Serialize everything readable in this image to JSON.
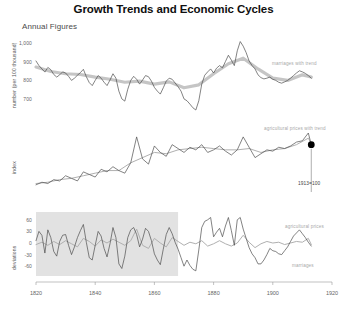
{
  "header": {
    "title": "Growth Trends and Economic Cycles",
    "subtitle": "Annual Figures"
  },
  "colors": {
    "series_dark": "#4d4d4d",
    "series_trend": "#c2c2c2",
    "series_light": "#b0b0b0",
    "shade_band": "#e2e2e2",
    "axis": "#999999",
    "marker": "#000000",
    "text": "#1a1a1a",
    "note": "#a9a9a9"
  },
  "chart_data": {
    "type": "line",
    "title": "Growth Trends and Economic Cycles",
    "subtitle": "Annual Figures",
    "xlabel": "",
    "xlim": [
      1820,
      1920
    ],
    "xticks": [
      1820,
      1840,
      1860,
      1880,
      1900,
      1920
    ],
    "grid": false,
    "legend_position": "inline-annotations",
    "panels": [
      {
        "id": "panel-marriages",
        "ylabel": "number (per 100 thousand)",
        "ylim": [
          640,
          1040
        ],
        "yticks": [
          1000,
          900,
          800,
          700
        ],
        "ytick_labels": [
          "1,000",
          "900",
          "800",
          "700"
        ],
        "annotations": [
          {
            "text": "marriages with trend",
            "x": 1898,
            "y": 900
          }
        ],
        "series": [
          {
            "name": "marriages",
            "style": "dark-thin",
            "x": [
              1820,
              1821,
              1822,
              1823,
              1824,
              1825,
              1826,
              1827,
              1828,
              1829,
              1830,
              1831,
              1832,
              1833,
              1834,
              1835,
              1836,
              1837,
              1838,
              1839,
              1840,
              1841,
              1842,
              1843,
              1844,
              1845,
              1846,
              1847,
              1848,
              1849,
              1850,
              1851,
              1852,
              1853,
              1854,
              1855,
              1856,
              1857,
              1858,
              1859,
              1860,
              1861,
              1862,
              1863,
              1864,
              1865,
              1866,
              1867,
              1868,
              1869,
              1870,
              1871,
              1872,
              1873,
              1874,
              1875,
              1876,
              1877,
              1878,
              1879,
              1880,
              1881,
              1882,
              1883,
              1884,
              1885,
              1886,
              1887,
              1888,
              1889,
              1890,
              1891,
              1892,
              1893,
              1894,
              1895,
              1896,
              1897,
              1898,
              1899,
              1900,
              1901,
              1902,
              1903,
              1904,
              1905,
              1906,
              1907,
              1908,
              1909,
              1910,
              1911,
              1912,
              1913
            ],
            "values": [
              905,
              880,
              862,
              845,
              870,
              858,
              832,
              818,
              830,
              846,
              840,
              822,
              800,
              812,
              828,
              842,
              860,
              820,
              788,
              772,
              800,
              826,
              812,
              790,
              772,
              802,
              836,
              812,
              742,
              700,
              688,
              752,
              800,
              822,
              806,
              780,
              802,
              826,
              820,
              796,
              762,
              742,
              726,
              760,
              796,
              812,
              806,
              786,
              766,
              742,
              700,
              690,
              672,
              652,
              640,
              690,
              780,
              828,
              846,
              862,
              840,
              866,
              880,
              868,
              902,
              936,
              910,
              880,
              960,
              1010,
              985,
              950,
              905,
              880,
              862,
              830,
              815,
              808,
              812,
              818,
              806,
              800,
              790,
              785,
              792,
              800,
              812,
              826,
              840,
              852,
              846,
              838,
              826,
              812
            ]
          },
          {
            "name": "marriages trend",
            "style": "trend-thick",
            "x": [
              1820,
              1825,
              1830,
              1835,
              1840,
              1845,
              1850,
              1855,
              1860,
              1865,
              1870,
              1875,
              1880,
              1885,
              1890,
              1895,
              1900,
              1905,
              1910,
              1913
            ],
            "values": [
              872,
              848,
              836,
              832,
              818,
              806,
              790,
              796,
              780,
              792,
              760,
              776,
              836,
              890,
              920,
              862,
              812,
              800,
              830,
              818
            ]
          }
        ]
      },
      {
        "id": "panel-prices",
        "ylabel": "index",
        "ylim": [
          30,
          135
        ],
        "yticks": [],
        "ytick_labels": [],
        "annotations": [
          {
            "text": "agricultural prices with trend",
            "x": 1898,
            "y": 128
          },
          {
            "text": "1913=100",
            "x": 1911,
            "y": 44,
            "marker": true
          }
        ],
        "marker": {
          "x": 1913,
          "y": 100,
          "label": "1913=100"
        },
        "series": [
          {
            "name": "agricultural prices",
            "style": "dark-thin",
            "x": [
              1820,
              1822,
              1824,
              1826,
              1828,
              1830,
              1832,
              1834,
              1836,
              1838,
              1840,
              1842,
              1844,
              1846,
              1848,
              1850,
              1852,
              1854,
              1856,
              1858,
              1860,
              1862,
              1864,
              1866,
              1868,
              1870,
              1872,
              1874,
              1876,
              1878,
              1880,
              1882,
              1884,
              1886,
              1888,
              1890,
              1892,
              1894,
              1896,
              1898,
              1900,
              1902,
              1904,
              1906,
              1908,
              1910,
              1912,
              1913
            ],
            "values": [
              38,
              42,
              40,
              46,
              44,
              52,
              48,
              44,
              58,
              54,
              50,
              62,
              58,
              66,
              60,
              56,
              72,
              112,
              78,
              70,
              98,
              88,
              82,
              100,
              94,
              88,
              96,
              92,
              100,
              88,
              92,
              98,
              90,
              84,
              92,
              112,
              96,
              80,
              86,
              92,
              90,
              96,
              94,
              98,
              104,
              106,
              118,
              100
            ]
          },
          {
            "name": "agricultural prices trend",
            "style": "light-thin",
            "x": [
              1820,
              1824,
              1828,
              1832,
              1836,
              1840,
              1844,
              1848,
              1852,
              1856,
              1860,
              1864,
              1868,
              1872,
              1876,
              1880,
              1884,
              1888,
              1892,
              1896,
              1900,
              1904,
              1908,
              1912,
              1913
            ],
            "values": [
              40,
              42,
              46,
              48,
              52,
              56,
              60,
              60,
              72,
              80,
              88,
              86,
              92,
              94,
              96,
              94,
              92,
              92,
              94,
              88,
              92,
              94,
              100,
              110,
              102
            ]
          }
        ]
      },
      {
        "id": "panel-deviations",
        "ylabel": "deviations",
        "ylim": [
          -75,
          75
        ],
        "yticks": [
          60,
          30,
          0,
          -30,
          -60
        ],
        "ytick_labels": [
          "60",
          "30",
          "0",
          "-30",
          "-60"
        ],
        "shaded_region": {
          "x0": 1820,
          "x1": 1868
        },
        "annotations": [
          {
            "text": "agricultural prices",
            "x": 1896,
            "y": 44
          },
          {
            "text": "marriages",
            "x": 1898,
            "y": -36
          }
        ],
        "series": [
          {
            "name": "marriages",
            "style": "dark-thin",
            "x": [
              1820,
              1821,
              1822,
              1823,
              1824,
              1825,
              1826,
              1827,
              1828,
              1829,
              1830,
              1831,
              1832,
              1833,
              1834,
              1835,
              1836,
              1837,
              1838,
              1839,
              1840,
              1841,
              1842,
              1843,
              1844,
              1845,
              1846,
              1847,
              1848,
              1849,
              1850,
              1851,
              1852,
              1853,
              1854,
              1855,
              1856,
              1857,
              1858,
              1859,
              1860,
              1861,
              1862,
              1863,
              1864,
              1865,
              1866,
              1867,
              1868,
              1869,
              1870,
              1871,
              1872,
              1873,
              1874,
              1875,
              1876,
              1877,
              1878,
              1879,
              1880,
              1881,
              1882,
              1883,
              1884,
              1885,
              1886,
              1887,
              1888,
              1889,
              1890,
              1891,
              1892,
              1893,
              1894,
              1895,
              1896,
              1897,
              1898,
              1899,
              1900,
              1901,
              1902,
              1903,
              1904,
              1905,
              1906,
              1907,
              1908,
              1909,
              1910,
              1911,
              1912,
              1913
            ],
            "values": [
              6,
              30,
              20,
              -26,
              34,
              14,
              -22,
              -34,
              4,
              20,
              22,
              -6,
              -30,
              -10,
              14,
              32,
              48,
              2,
              -38,
              -44,
              -6,
              30,
              18,
              -14,
              -36,
              -2,
              40,
              14,
              -54,
              -66,
              -34,
              14,
              34,
              40,
              22,
              -10,
              10,
              38,
              30,
              6,
              -28,
              -44,
              -56,
              -16,
              22,
              40,
              24,
              2,
              -16,
              -38,
              -60,
              -44,
              -58,
              -68,
              -72,
              -18,
              40,
              56,
              60,
              66,
              16,
              28,
              38,
              16,
              44,
              66,
              32,
              -6,
              60,
              66,
              36,
              12,
              -12,
              -28,
              -38,
              -54,
              -54,
              -44,
              -30,
              -14,
              -20,
              -22,
              -28,
              -30,
              -20,
              -10,
              4,
              18,
              26,
              34,
              24,
              14,
              2,
              -8
            ]
          },
          {
            "name": "agricultural prices",
            "style": "light-thin",
            "x": [
              1820,
              1822,
              1824,
              1826,
              1828,
              1830,
              1832,
              1834,
              1836,
              1838,
              1840,
              1842,
              1844,
              1846,
              1848,
              1850,
              1852,
              1854,
              1856,
              1858,
              1860,
              1862,
              1864,
              1866,
              1868,
              1870,
              1872,
              1874,
              1876,
              1878,
              1880,
              1882,
              1884,
              1886,
              1888,
              1890,
              1892,
              1894,
              1896,
              1898,
              1900,
              1902,
              1904,
              1906,
              1908,
              1910,
              1912,
              1913
            ],
            "values": [
              -4,
              2,
              -6,
              4,
              -4,
              6,
              -2,
              -10,
              12,
              4,
              -8,
              8,
              0,
              10,
              2,
              -6,
              6,
              36,
              -6,
              -14,
              12,
              0,
              -10,
              14,
              4,
              -6,
              2,
              -2,
              6,
              -8,
              -2,
              6,
              -2,
              -8,
              0,
              20,
              2,
              -12,
              -2,
              4,
              0,
              2,
              -4,
              0,
              4,
              2,
              12,
              -4
            ]
          }
        ]
      }
    ]
  }
}
